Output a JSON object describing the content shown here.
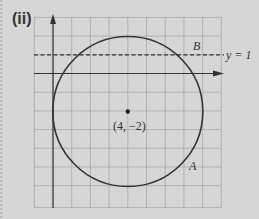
{
  "part_label": "(ii)",
  "diagram": {
    "type": "coordinate-geometry",
    "circle": {
      "center": [
        4,
        -2
      ],
      "radius": 4
    },
    "center_label": "(4, −2)",
    "line": {
      "equation": "y = 1",
      "label": "y = 1",
      "style": "dashed"
    },
    "points": [
      {
        "name": "B",
        "label": "B"
      },
      {
        "name": "A",
        "label": "A"
      }
    ],
    "grid": {
      "cols": 10,
      "rows": 10,
      "unit_px": 18.7
    }
  },
  "colors": {
    "background": "#d6d6d6",
    "grid": "#a9a9a9",
    "ink": "#333333"
  }
}
